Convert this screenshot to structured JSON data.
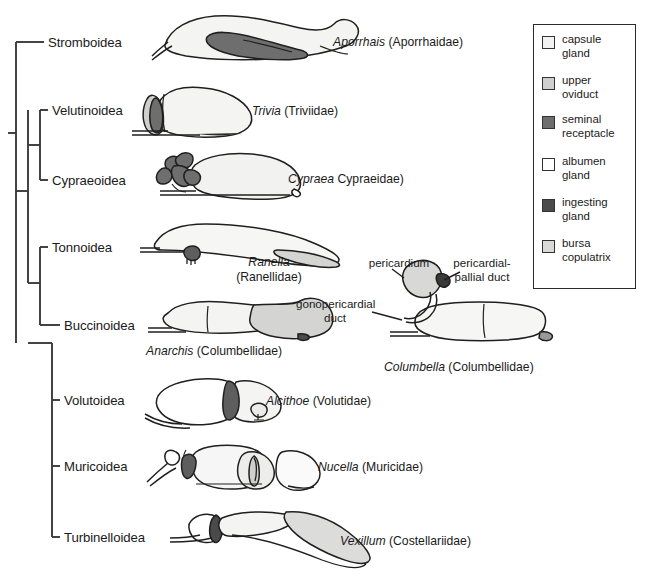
{
  "figure": {
    "type": "phylogenetic-tree-with-anatomical-illustrations",
    "background_color": "#ffffff",
    "line_color": "#3a3a3a"
  },
  "tree": {
    "clades": [
      {
        "id": "stromboidea",
        "label": "Stromboidea",
        "tip_y": 42
      },
      {
        "id": "velutinoidea",
        "label": "Velutinoidea",
        "tip_y": 110
      },
      {
        "id": "cypraeoidea",
        "label": "Cypraeoidea",
        "tip_y": 180
      },
      {
        "id": "tonnoidea",
        "label": "Tonnoidea",
        "tip_y": 247
      },
      {
        "id": "buccinoidea",
        "label": "Buccinoidea",
        "tip_y": 325
      },
      {
        "id": "volutoidea",
        "label": "Volutoidea",
        "tip_y": 400
      },
      {
        "id": "muricoidea",
        "label": "Muricoidea",
        "tip_y": 466
      },
      {
        "id": "turbinelloidea",
        "label": "Turbinelloidea",
        "tip_y": 537
      }
    ]
  },
  "taxa": [
    {
      "id": "aporrhais",
      "genus": "Aporrhais",
      "family": "(Aporrhaidae)",
      "full_label": "Aporrhais (Aporrhaidae)",
      "clade": "Stromboidea"
    },
    {
      "id": "trivia",
      "genus": "Trivia",
      "family": "(Triviidae)",
      "full_label": "Trivia (Triviidae)",
      "clade": "Velutinoidea"
    },
    {
      "id": "cypraea",
      "genus": "Cypraea",
      "family": "Cypraeidae)",
      "full_label": "Cypraea Cypraeidae)",
      "clade": "Cypraeoidea"
    },
    {
      "id": "ranella",
      "genus": "Ranella",
      "family": "(Ranellidae)",
      "full_label": "Ranella (Ranellidae)",
      "clade": "Tonnoidea"
    },
    {
      "id": "anarchis",
      "genus": "Anarchis",
      "family": "(Columbellidae)",
      "full_label": "Anarchis (Columbellidae)",
      "clade": "Buccinoidea"
    },
    {
      "id": "columbella",
      "genus": "Columbella",
      "family": "(Columbellidae)",
      "full_label": "Columbella (Columbellidae)",
      "clade": "Buccinoidea"
    },
    {
      "id": "alcithoe",
      "genus": "Alcithoe",
      "family": "(Volutidae)",
      "full_label": "Alcithoe (Volutidae)",
      "clade": "Volutoidea"
    },
    {
      "id": "nucella",
      "genus": "Nucella",
      "family": "(Muricidae)",
      "full_label": "Nucella (Muricidae)",
      "clade": "Muricoidea"
    },
    {
      "id": "vexillum",
      "genus": "Vexillum",
      "family": "(Costellariidae)",
      "full_label": "Vexillum (Costellariidae)",
      "clade": "Turbinelloidea"
    }
  ],
  "annotations": [
    {
      "id": "pericardium",
      "label": "pericardium"
    },
    {
      "id": "pericardial-pallial-duct",
      "label": "pericardial-\npallial duct"
    },
    {
      "id": "gonopericardial-duct",
      "label": "gonopericardial\nduct"
    }
  ],
  "legend": {
    "items": [
      {
        "id": "capsule-gland",
        "label": "capsule\ngland",
        "color": "#f2f2f0"
      },
      {
        "id": "upper-oviduct",
        "label": "upper\noviduct",
        "color": "#cfcfcd"
      },
      {
        "id": "seminal-receptacle",
        "label": "seminal\nreceptacle",
        "color": "#6e6e6e"
      },
      {
        "id": "albumen-gland",
        "label": "albumen\ngland",
        "color": "#ffffff"
      },
      {
        "id": "ingesting-gland",
        "label": "ingesting\ngland",
        "color": "#4a4a4a"
      },
      {
        "id": "bursa-copulatrix",
        "label": "bursa\ncopulatrix",
        "color": "#d9d9d7"
      }
    ]
  }
}
